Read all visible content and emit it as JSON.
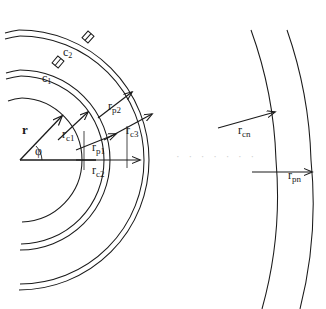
{
  "figure": {
    "background": "#ffffff",
    "stroke_color": "#1a1a1a",
    "ellipsis_color": "#cfcfcf",
    "width": 326,
    "height": 309,
    "origin": {
      "x": 20,
      "y": 160
    }
  },
  "vectors": {
    "r": {
      "label": "r",
      "angle_label": "φ",
      "angle_deg": 45
    },
    "phi": {
      "label": "φ"
    }
  },
  "radii_labels": [
    {
      "id": "rc1",
      "base": "r",
      "sub": "c1",
      "x": 62,
      "y": 124
    },
    {
      "id": "rp2",
      "base": "r",
      "sub": "p2",
      "x": 108,
      "y": 96
    },
    {
      "id": "rc3",
      "base": "r",
      "sub": "c3",
      "x": 126,
      "y": 120
    },
    {
      "id": "rp1",
      "base": "r",
      "sub": "p1",
      "x": 92,
      "y": 137
    },
    {
      "id": "rc2",
      "base": "r",
      "sub": "c2",
      "x": 92,
      "y": 160
    },
    {
      "id": "rcn",
      "base": "r",
      "sub": "cn",
      "x": 238,
      "y": 120
    },
    {
      "id": "rpn",
      "base": "r",
      "sub": "pn",
      "x": 288,
      "y": 165
    }
  ],
  "shell_labels": [
    {
      "id": "c1",
      "base": "c",
      "sub": "1",
      "x": 42,
      "y": 71
    },
    {
      "id": "c2",
      "base": "c",
      "sub": "2",
      "x": 63,
      "y": 45
    }
  ],
  "ellipsis": {
    "text": "· · · · · · ·",
    "x": 176,
    "y": 150
  }
}
